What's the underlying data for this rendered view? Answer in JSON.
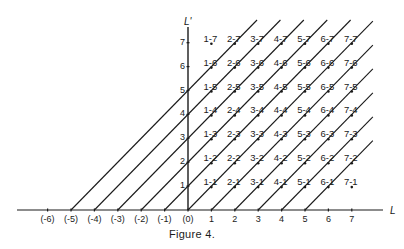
{
  "figure": {
    "caption": "Figure 4.",
    "x_axis_label": "L",
    "y_axis_label": "L'",
    "x_tick_labels": [
      "(-6)",
      "(-5)",
      "(-4)",
      "(-3)",
      "(-2)",
      "(-1)",
      "(0)",
      "1",
      "2",
      "3",
      "4",
      "5",
      "6",
      "7"
    ],
    "x_tick_values": [
      -6,
      -5,
      -4,
      -3,
      -2,
      -1,
      0,
      1,
      2,
      3,
      4,
      5,
      6,
      7
    ],
    "y_tick_labels": [
      "1",
      "2",
      "3",
      "4",
      "5",
      "6",
      "7"
    ],
    "y_tick_values": [
      1,
      2,
      3,
      4,
      5,
      6,
      7
    ],
    "diagonal_line_origins": [
      -5,
      -4,
      -3,
      -2,
      -1,
      0,
      1,
      2,
      3,
      4,
      5
    ],
    "grid_points": {
      "l_values": [
        1,
        2,
        3,
        4,
        5,
        6,
        7
      ],
      "lprime_values": [
        1,
        2,
        3,
        4,
        5,
        6,
        7
      ],
      "label_format": "{l}-{lp}"
    },
    "colors": {
      "ink": "#1a1a1a",
      "background": "#ffffff"
    }
  },
  "chart_data": {
    "type": "diagram",
    "title": "Figure 4.",
    "xlabel": "L",
    "ylabel": "L'",
    "x_ticks": [
      "(-6)",
      "(-5)",
      "(-4)",
      "(-3)",
      "(-2)",
      "(-1)",
      "(0)",
      "1",
      "2",
      "3",
      "4",
      "5",
      "6",
      "7"
    ],
    "y_ticks": [
      "1",
      "2",
      "3",
      "4",
      "5",
      "6",
      "7"
    ],
    "xlim": [
      -7.3,
      8.3
    ],
    "ylim": [
      0,
      8
    ],
    "lines": "45-degree diagonals L' = L - k for k in -5..5, from L axis to upper/right edge",
    "points": "labeled lattice points 'L-L'' for L, L' in 1..7"
  }
}
